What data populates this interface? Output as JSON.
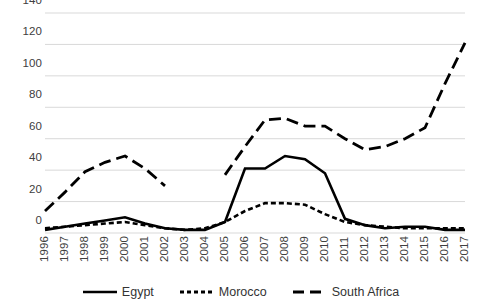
{
  "chart_data": {
    "type": "line",
    "title": "",
    "xlabel": "",
    "ylabel": "",
    "categories": [
      "1996",
      "1997",
      "1998",
      "1999",
      "2000",
      "2001",
      "2002",
      "2003",
      "2004",
      "2005",
      "2006",
      "2007",
      "2008",
      "2009",
      "2010",
      "2011",
      "2012",
      "2013",
      "2014",
      "2015",
      "2016",
      "2017"
    ],
    "ylim": [
      0,
      140
    ],
    "yticks": [
      0,
      20,
      40,
      60,
      80,
      100,
      120,
      140
    ],
    "grid": "horizontal",
    "legend_position": "bottom",
    "series": [
      {
        "name": "Egypt",
        "style": "solid",
        "color": "#000000",
        "values": [
          2,
          4,
          6,
          8,
          10,
          6,
          3,
          2,
          2,
          7,
          41,
          41,
          49,
          47,
          38,
          9,
          5,
          3,
          4,
          4,
          2,
          2
        ]
      },
      {
        "name": "Morocco",
        "style": "dotted",
        "color": "#000000",
        "values": [
          3,
          4,
          5,
          6,
          7,
          5,
          3,
          2,
          3,
          7,
          14,
          19,
          19,
          18,
          12,
          7,
          5,
          4,
          3,
          3,
          3,
          3
        ]
      },
      {
        "name": "South Africa",
        "style": "dashed",
        "color": "#000000",
        "values": [
          14,
          26,
          39,
          45,
          49,
          41,
          30,
          null,
          null,
          37,
          55,
          72,
          73,
          68,
          68,
          60,
          53,
          55,
          60,
          67,
          95,
          121
        ]
      }
    ]
  },
  "axis": {
    "y_labels": [
      "140",
      "120",
      "100",
      "80",
      "60",
      "40",
      "20",
      "0"
    ],
    "x_labels": [
      "1996",
      "1997",
      "1998",
      "1999",
      "2000",
      "2001",
      "2002",
      "2003",
      "2004",
      "2005",
      "2006",
      "2007",
      "2008",
      "2009",
      "2010",
      "2011",
      "2012",
      "2013",
      "2014",
      "2015",
      "2016",
      "2017"
    ]
  },
  "legend": {
    "items": [
      {
        "label": "Egypt",
        "style": "solid"
      },
      {
        "label": "Morocco",
        "style": "dotted"
      },
      {
        "label": "South Africa",
        "style": "dashed"
      }
    ]
  },
  "colors": {
    "grid": "#d9d9d9",
    "line": "#000000",
    "text": "#404040",
    "background": "#ffffff"
  }
}
